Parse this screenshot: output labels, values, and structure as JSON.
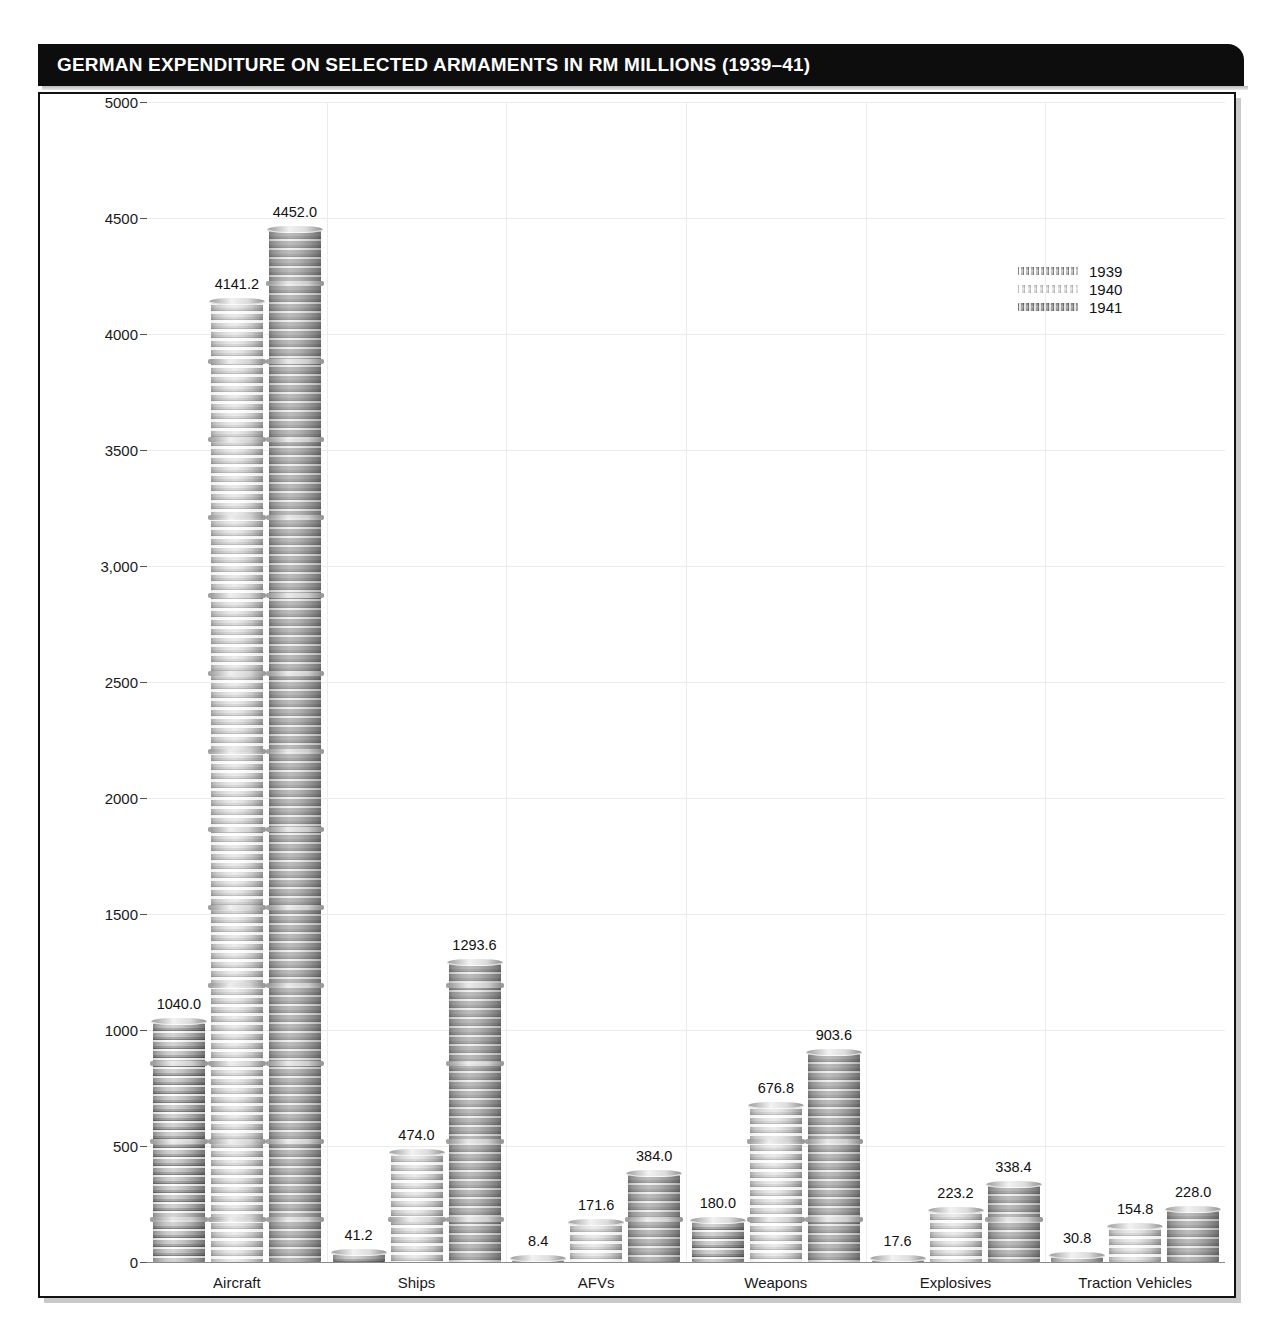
{
  "figure": {
    "title": "GERMAN EXPENDITURE ON SELECTED ARMAMENTS IN RM MILLIONS (1939–41)",
    "accent_color": "#0d0d0d",
    "background_color": "#ffffff"
  },
  "legend": {
    "position": "top-right",
    "entries": [
      {
        "label": "1939",
        "swatch": "coin-stack-1939"
      },
      {
        "label": "1940",
        "swatch": "coin-stack-1940"
      },
      {
        "label": "1941",
        "swatch": "coin-stack-1941"
      }
    ]
  },
  "chart_data": {
    "type": "bar",
    "title": "GERMAN EXPENDITURE ON SELECTED ARMAMENTS IN RM MILLIONS (1939–41)",
    "xlabel": "",
    "ylabel": "",
    "ylim": [
      0,
      5000
    ],
    "grid": true,
    "legend_position": "top-right",
    "categories": [
      "Aircraft",
      "Ships",
      "AFVs",
      "Weapons",
      "Explosives",
      "Traction Vehicles"
    ],
    "ytick_labels": [
      "0",
      "500",
      "1000",
      "1500",
      "2000",
      "2500",
      "3,000",
      "3500",
      "4000",
      "4500",
      "5000"
    ],
    "ytick_values": [
      0,
      500,
      1000,
      1500,
      2000,
      2500,
      3000,
      3500,
      4000,
      4500,
      5000
    ],
    "series": [
      {
        "name": "1939",
        "values": [
          1040.0,
          41.2,
          8.4,
          180.0,
          17.6,
          30.8
        ],
        "labels": [
          "1040.0",
          "41.2",
          "8.4",
          "180.0",
          "17.6",
          "30.8"
        ]
      },
      {
        "name": "1940",
        "values": [
          4141.2,
          474.0,
          171.6,
          676.8,
          223.2,
          154.8
        ],
        "labels": [
          "4141.2",
          "474.0",
          "171.6",
          "676.8",
          "223.2",
          "154.8"
        ]
      },
      {
        "name": "1941",
        "values": [
          4452.0,
          1293.6,
          384.0,
          903.6,
          338.4,
          228.0
        ],
        "labels": [
          "4452.0",
          "1293.6",
          "384.0",
          "903.6",
          "338.4",
          "228.0"
        ]
      }
    ]
  }
}
